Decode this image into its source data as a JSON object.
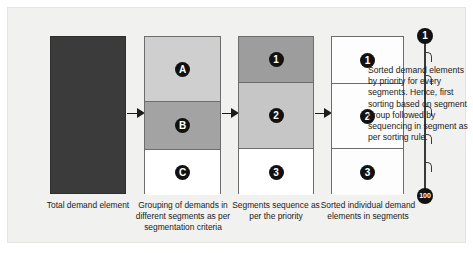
{
  "figure": {
    "background_color": "#f1f1ef",
    "frame_color": "#e4e4e1"
  },
  "columns": [
    {
      "id": "total-demand",
      "caption": "Total demand element",
      "fill": "#3b3b3b",
      "cells": []
    },
    {
      "id": "grouping",
      "caption": "Grouping of demands in different segments as per segmentation criteria",
      "cells": [
        {
          "label": "A",
          "fill": "#cfcfcf"
        },
        {
          "label": "B",
          "fill": "#a3a3a3"
        },
        {
          "label": "C",
          "fill": "#ffffff"
        }
      ]
    },
    {
      "id": "segments-sequence",
      "caption": "Segments sequence as per the priority",
      "cells": [
        {
          "label": "1",
          "fill": "#9d9d9d"
        },
        {
          "label": "2",
          "fill": "#c6c6c6"
        },
        {
          "label": "3",
          "fill": "#ffffff"
        }
      ]
    },
    {
      "id": "sorted-elements",
      "caption": "Sorted individual demand elements in segments",
      "cells": [
        {
          "label": "1",
          "fill": "#fdfdfd"
        },
        {
          "label": "2",
          "fill": "#fdfdfd"
        },
        {
          "label": "3",
          "fill": "#fdfdfd"
        }
      ]
    }
  ],
  "arrows": [
    {
      "id": "arrow-1-to-2"
    },
    {
      "id": "arrow-2-to-3"
    },
    {
      "id": "arrow-3-to-4"
    }
  ],
  "rail": {
    "top_marker": "1",
    "bottom_marker": "100",
    "marker_color": "#111111"
  },
  "note": {
    "text": "Sorted demand elements by priority for every segments. Hence, first sorting based on segment group followed by sequencing in segment as per sorting rule."
  }
}
